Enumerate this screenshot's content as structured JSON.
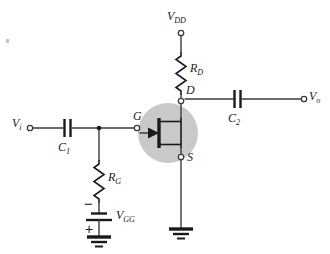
{
  "figure": {
    "kind": "circuit-schematic",
    "background_color": "#ffffff",
    "wire_color": "#3c3c3c",
    "symbol_color": "#1a1a1a",
    "highlight_circle_color": "#c9c9c9"
  },
  "terminals": {
    "input": {
      "symbol": "V",
      "subscript": "i"
    },
    "output": {
      "symbol": "V",
      "subscript": "o"
    },
    "supply": {
      "symbol": "V",
      "subscript": "DD"
    }
  },
  "nodes": {
    "gate": "G",
    "drain": "D",
    "source": "S"
  },
  "components": {
    "c1": {
      "symbol": "C",
      "subscript": "1",
      "type": "capacitor"
    },
    "c2": {
      "symbol": "C",
      "subscript": "2",
      "type": "capacitor"
    },
    "rd": {
      "symbol": "R",
      "subscript": "D",
      "type": "resistor"
    },
    "rg": {
      "symbol": "R",
      "subscript": "G",
      "type": "resistor"
    },
    "vgg": {
      "symbol": "V",
      "subscript": "GG",
      "type": "battery"
    },
    "jfet": {
      "type": "n-channel-jfet"
    }
  },
  "polarity": {
    "battery_top": "−",
    "battery_bottom": "+"
  }
}
